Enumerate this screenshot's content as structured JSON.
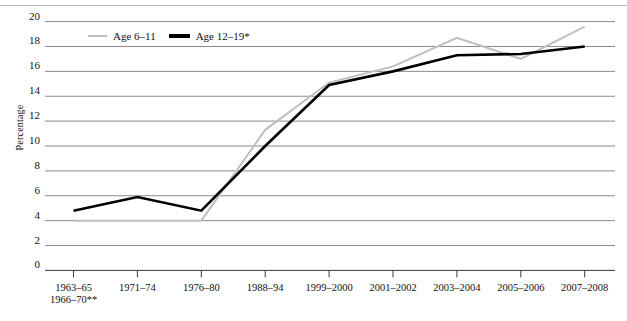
{
  "chart_data": {
    "type": "line",
    "title": "",
    "xlabel": "",
    "ylabel": "Percentage",
    "ylim": [
      0,
      20
    ],
    "ytick_step": 2,
    "grid": true,
    "legend_position": "top-left-inside",
    "categories": [
      "1963–65\n1966–70**",
      "1971–74",
      "1976–80",
      "1988–94",
      "1999–2000",
      "2001–2002",
      "2003–2004",
      "2005–2006",
      "2007–2008"
    ],
    "series": [
      {
        "name": "Age 6–11",
        "color": "#bfbfbf",
        "values": [
          4.0,
          4.0,
          4.0,
          11.3,
          15.1,
          16.4,
          18.7,
          17.0,
          19.6
        ]
      },
      {
        "name": "Age 12–19*",
        "color": "#000000",
        "values": [
          4.8,
          5.9,
          4.8,
          10.0,
          14.9,
          16.0,
          17.3,
          17.4,
          18.0
        ]
      }
    ]
  },
  "axis": {
    "y_ticks": [
      "20",
      "18",
      "16",
      "14",
      "12",
      "10",
      "8",
      "6",
      "4",
      "2",
      "0"
    ],
    "y_label": "Percentage",
    "x_ticks": [
      {
        "line1": "1963–65",
        "line2": "1966–70**"
      },
      {
        "line1": "1971–74",
        "line2": ""
      },
      {
        "line1": "1976–80",
        "line2": ""
      },
      {
        "line1": "1988–94",
        "line2": ""
      },
      {
        "line1": "1999–2000",
        "line2": ""
      },
      {
        "line1": "2001–2002",
        "line2": ""
      },
      {
        "line1": "2003–2004",
        "line2": ""
      },
      {
        "line1": "2005–2006",
        "line2": ""
      },
      {
        "line1": "2007–2008",
        "line2": ""
      }
    ]
  },
  "legend": {
    "items": [
      {
        "label": "Age 6–11",
        "color": "#bfbfbf"
      },
      {
        "label": "Age 12–19*",
        "color": "#000000"
      }
    ]
  },
  "colors": {
    "gridline": "#8a8a8a",
    "axis": "#3a3a3a",
    "series_gray": "#bfbfbf",
    "series_black": "#000000",
    "background": "#ffffff"
  }
}
